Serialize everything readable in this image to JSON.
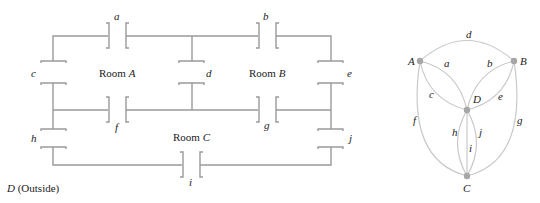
{
  "floor_plan": {
    "rooms": [
      {
        "id": "A",
        "prefix": "Room ",
        "letter": "A"
      },
      {
        "id": "B",
        "prefix": "Room ",
        "letter": "B"
      },
      {
        "id": "C",
        "prefix": "Room ",
        "letter": "C"
      }
    ],
    "outside": {
      "letter": "D",
      "suffix": " (Outside)"
    },
    "doors": [
      "a",
      "b",
      "c",
      "d",
      "e",
      "f",
      "g",
      "h",
      "i",
      "j"
    ]
  },
  "graph": {
    "vertices": [
      {
        "id": "A",
        "label": "A"
      },
      {
        "id": "B",
        "label": "B"
      },
      {
        "id": "C",
        "label": "C"
      },
      {
        "id": "D",
        "label": "D"
      }
    ],
    "edges": [
      {
        "label": "a",
        "from": "A",
        "to": "D"
      },
      {
        "label": "b",
        "from": "B",
        "to": "D"
      },
      {
        "label": "c",
        "from": "A",
        "to": "D"
      },
      {
        "label": "d",
        "from": "A",
        "to": "B"
      },
      {
        "label": "e",
        "from": "B",
        "to": "D"
      },
      {
        "label": "f",
        "from": "A",
        "to": "C"
      },
      {
        "label": "g",
        "from": "B",
        "to": "C"
      },
      {
        "label": "h",
        "from": "D",
        "to": "C"
      },
      {
        "label": "i",
        "from": "D",
        "to": "C"
      },
      {
        "label": "j",
        "from": "D",
        "to": "C"
      }
    ]
  }
}
